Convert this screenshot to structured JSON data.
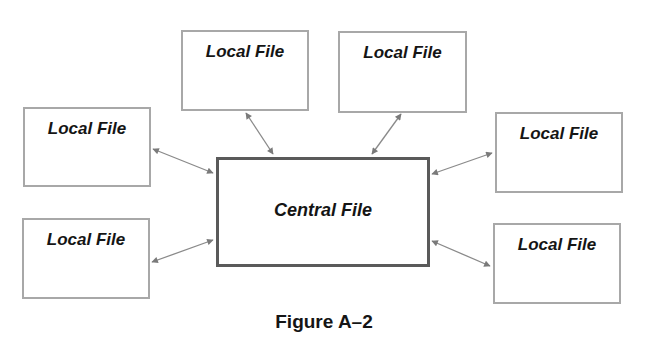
{
  "diagram": {
    "central": {
      "label": "Central File"
    },
    "locals": [
      {
        "id": "top-left",
        "label": "Local File"
      },
      {
        "id": "top-right",
        "label": "Local File"
      },
      {
        "id": "left-upper",
        "label": "Local File"
      },
      {
        "id": "left-lower",
        "label": "Local File"
      },
      {
        "id": "right-upper",
        "label": "Local File"
      },
      {
        "id": "right-lower",
        "label": "Local File"
      }
    ],
    "connections": [
      {
        "from": "top-left",
        "to": "central",
        "type": "bidirectional-arrow"
      },
      {
        "from": "top-right",
        "to": "central",
        "type": "bidirectional-arrow"
      },
      {
        "from": "left-upper",
        "to": "central",
        "type": "bidirectional-arrow"
      },
      {
        "from": "left-lower",
        "to": "central",
        "type": "bidirectional-arrow"
      },
      {
        "from": "right-upper",
        "to": "central",
        "type": "bidirectional-arrow"
      },
      {
        "from": "right-lower",
        "to": "central",
        "type": "bidirectional-arrow"
      }
    ],
    "colors": {
      "local_border": "#a8a8a8",
      "central_border": "#5a5a5a",
      "arrow": "#7a7a7a",
      "text": "#151515"
    }
  },
  "caption": "Figure A–2"
}
